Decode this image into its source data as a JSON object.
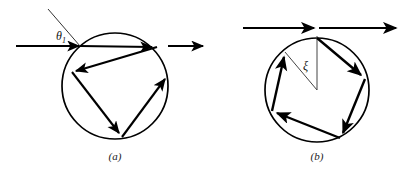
{
  "figure": {
    "title": "",
    "background_color": "#ffffff",
    "stroke_color": "#000000",
    "thin_stroke_color": "#555555",
    "width": 411,
    "height": 169
  },
  "panels": [
    {
      "id": "a",
      "caption": "(a)",
      "angle_label": "θ",
      "angle_subscript": "1",
      "circle": {
        "cx": 115,
        "cy": 86,
        "r": 53
      },
      "incoming_ray": {
        "x1": 16,
        "y1": 46,
        "x2": 80,
        "y2": 46,
        "label": "incident-ray"
      },
      "outgoing_ray": {
        "x1": 168,
        "y1": 46,
        "x2": 207,
        "y2": 46,
        "label": "emergent-ray"
      },
      "normal_line": {
        "x1": 80,
        "y1": 46,
        "x2": 48,
        "y2": 9
      },
      "internal_path": [
        {
          "x1": 80,
          "y1": 46,
          "x2": 157,
          "y2": 47
        },
        {
          "x1": 157,
          "y1": 47,
          "x2": 72,
          "y2": 72
        },
        {
          "x1": 72,
          "y1": 72,
          "x2": 122,
          "y2": 137
        },
        {
          "x1": 122,
          "y1": 137,
          "x2": 168,
          "y2": 75
        }
      ],
      "reflection_count": 3
    },
    {
      "id": "b",
      "caption": "(b)",
      "angle_label": "ξ",
      "angle_subscript": "",
      "circle": {
        "cx": 317,
        "cy": 90,
        "r": 52
      },
      "incoming_ray": {
        "x1": 243,
        "y1": 28,
        "x2": 317,
        "y2": 28,
        "label": "incident-ray"
      },
      "outgoing_ray": {
        "x1": 317,
        "y1": 28,
        "x2": 400,
        "y2": 28,
        "label": "emergent-ray"
      },
      "normal_line": {
        "x1": 317,
        "y1": 90,
        "x2": 317,
        "y2": 38
      },
      "chord_line": {
        "x1": 317,
        "y1": 90,
        "x2": 285,
        "y2": 52
      },
      "internal_path": [
        {
          "x1": 317,
          "y1": 38,
          "x2": 365,
          "y2": 79
        },
        {
          "x1": 365,
          "y1": 79,
          "x2": 340,
          "y2": 138
        },
        {
          "x1": 340,
          "y1": 138,
          "x2": 272,
          "y2": 111
        },
        {
          "x1": 272,
          "y1": 111,
          "x2": 285,
          "y2": 52
        }
      ],
      "reflection_count": 4
    }
  ],
  "captions": {
    "panel_a": "(a)",
    "panel_b": "(b)"
  },
  "labels": {
    "theta_base": "θ",
    "theta_sub": "1",
    "xi": "ξ"
  }
}
